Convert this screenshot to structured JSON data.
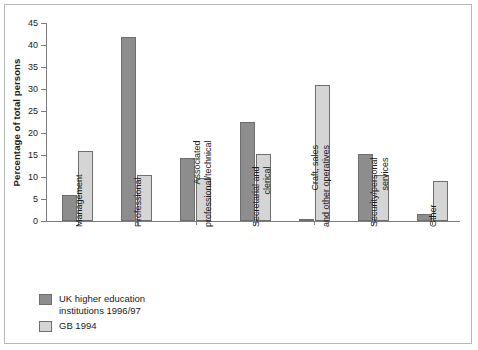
{
  "chart_data": {
    "type": "bar",
    "title": "",
    "xlabel": "",
    "ylabel": "Percentage of total persons",
    "ylim": [
      0,
      45
    ],
    "yticks": [
      0,
      5,
      10,
      15,
      20,
      25,
      30,
      35,
      40,
      45
    ],
    "grid": false,
    "legend_position": "bottom-left",
    "categories": [
      "Management",
      "Professional",
      "Associated\nprofessional/technical",
      "Secretarial and\nclerical",
      "Craft, sales\nand other operatives",
      "Security/personal\nservices",
      "Other"
    ],
    "category_lines": [
      [
        "Management"
      ],
      [
        "Professional"
      ],
      [
        "Associated",
        "professional/technical"
      ],
      [
        "Secretarial and",
        "clerical"
      ],
      [
        "Craft, sales",
        "and other operatives"
      ],
      [
        "Security/personal",
        "services"
      ],
      [
        "Other"
      ]
    ],
    "series": [
      {
        "name": "UK higher education institutions 1996/97",
        "color": "#8d8d8d",
        "values": [
          5.8,
          41.8,
          14.3,
          22.6,
          0.4,
          15.2,
          1.5
        ]
      },
      {
        "name": "GB 1994",
        "color": "#d5d5d5",
        "values": [
          16.0,
          10.4,
          9.7,
          15.3,
          31.0,
          10.4,
          9.0
        ]
      }
    ]
  },
  "legend": {
    "items": [
      {
        "label": "UK higher education\ninstitutions 1996/97",
        "swatch": "s0"
      },
      {
        "label": "GB 1994",
        "swatch": "s1"
      }
    ]
  },
  "colors": {
    "series_dark": "#8d8d8d",
    "series_light": "#d5d5d5",
    "axis": "#7d7d7d",
    "frame": "#b9b9b9",
    "text": "#1a1a1a"
  }
}
